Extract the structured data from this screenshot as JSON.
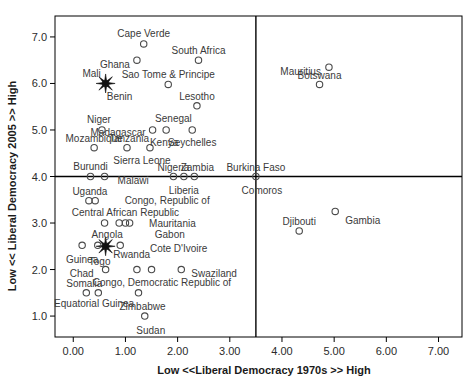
{
  "chart_data": {
    "type": "scatter",
    "title": "",
    "xlabel": "Low <<Liberal Democracy 1970s >> High",
    "ylabel": "Low << Liberal Democracy 2005 >> High",
    "xlim": [
      -0.35,
      7.45
    ],
    "ylim": [
      0.55,
      7.45
    ],
    "xticks": [
      "0.00",
      "1.00",
      "2.00",
      "3.00",
      "4.00",
      "5.00",
      "6.00",
      "7.00"
    ],
    "xtickvals": [
      0,
      1,
      2,
      3,
      4,
      5,
      6,
      7
    ],
    "yticks": [
      "1.0",
      "2.0",
      "3.0",
      "4.0",
      "5.0",
      "6.0",
      "7.0"
    ],
    "ytickvals": [
      1,
      2,
      3,
      4,
      5,
      6,
      7
    ],
    "grid": false,
    "legend": "none",
    "quadrant_lines": {
      "vertical_x": 3.5,
      "horizontal_y": 4.0
    },
    "points": [
      {
        "label": "Cape Verde",
        "x": 1.35,
        "y": 6.85,
        "marker": "circle",
        "label_dx": 0,
        "label_dy": -10,
        "anchor": "middle"
      },
      {
        "label": "South Africa",
        "x": 2.4,
        "y": 6.5,
        "marker": "circle",
        "label_dx": 0,
        "label_dy": -10,
        "anchor": "middle"
      },
      {
        "label": "Mauritius",
        "x": 4.9,
        "y": 6.35,
        "marker": "circle",
        "label_dx": -8,
        "label_dy": 4,
        "anchor": "end"
      },
      {
        "label": "Ghana",
        "x": 1.22,
        "y": 6.5,
        "marker": "circle",
        "label_dx": -7,
        "label_dy": 4,
        "anchor": "end"
      },
      {
        "label": "Botswana",
        "x": 4.72,
        "y": 5.98,
        "marker": "circle",
        "label_dx": 0,
        "label_dy": -9,
        "anchor": "middle"
      },
      {
        "label": "Sao Tome & Principe",
        "x": 1.82,
        "y": 5.98,
        "marker": "circle",
        "label_dx": 0,
        "label_dy": -10,
        "anchor": "middle"
      },
      {
        "label": "Mali",
        "x": 0.62,
        "y": 6.0,
        "marker": "star",
        "label_dx": -14,
        "label_dy": -10,
        "anchor": "middle"
      },
      {
        "label": "Benin",
        "x": 0.62,
        "y": 6.0,
        "marker": "none",
        "label_dx": 14,
        "label_dy": 13,
        "anchor": "middle"
      },
      {
        "label": "Lesotho",
        "x": 2.37,
        "y": 5.52,
        "marker": "circle",
        "label_dx": 0,
        "label_dy": -9,
        "anchor": "middle"
      },
      {
        "label": "Senegal",
        "x": 1.92,
        "y": 5.25,
        "marker": "none",
        "label_dx": 0,
        "label_dy": 0,
        "anchor": "middle"
      },
      {
        "label": "Niger",
        "x": 0.55,
        "y": 5.0,
        "marker": "circle",
        "label_dx": -3,
        "label_dy": -10,
        "anchor": "middle"
      },
      {
        "label": "Madagascar",
        "x": 1.52,
        "y": 5.0,
        "marker": "circle",
        "label_dx": -7,
        "label_dy": 3,
        "anchor": "end"
      },
      {
        "label": "Kenya",
        "x": 1.78,
        "y": 5.0,
        "marker": "circle",
        "label_dx": -2,
        "label_dy": 13,
        "anchor": "middle"
      },
      {
        "label": "Seychelles",
        "x": 2.28,
        "y": 5.0,
        "marker": "circle",
        "label_dx": 0,
        "label_dy": 13,
        "anchor": "middle"
      },
      {
        "label": "Mozambique",
        "x": 0.4,
        "y": 4.62,
        "marker": "circle",
        "label_dx": 0,
        "label_dy": -9,
        "anchor": "middle"
      },
      {
        "label": "Tanzania",
        "x": 1.03,
        "y": 4.62,
        "marker": "circle",
        "label_dx": 2,
        "label_dy": -9,
        "anchor": "middle"
      },
      {
        "label": "Sierra Leone",
        "x": 1.47,
        "y": 4.62,
        "marker": "circle",
        "label_dx": -8,
        "label_dy": 13,
        "anchor": "middle"
      },
      {
        "label": "Burundi",
        "x": 0.33,
        "y": 4.0,
        "marker": "circle",
        "label_dx": 0,
        "label_dy": -10,
        "anchor": "middle"
      },
      {
        "label": "Malawi",
        "x": 0.6,
        "y": 4.0,
        "marker": "circle",
        "label_dx": 13,
        "label_dy": 4,
        "anchor": "start"
      },
      {
        "label": "Nigeria",
        "x": 1.92,
        "y": 4.0,
        "marker": "circle",
        "label_dx": 0,
        "label_dy": -9,
        "anchor": "middle"
      },
      {
        "label": "Zambia",
        "x": 2.32,
        "y": 4.0,
        "marker": "circle",
        "label_dx": 3,
        "label_dy": -9,
        "anchor": "middle"
      },
      {
        "label": "Liberia",
        "x": 2.12,
        "y": 4.0,
        "marker": "circle",
        "label_dx": 0,
        "label_dy": 14,
        "anchor": "middle"
      },
      {
        "label": "Burkina Faso",
        "x": 3.5,
        "y": 4.0,
        "marker": "circle",
        "label_dx": 0,
        "label_dy": -9,
        "anchor": "middle"
      },
      {
        "label": "Comoros",
        "x": 3.5,
        "y": 4.0,
        "marker": "none",
        "label_dx": 6,
        "label_dy": 14,
        "anchor": "middle"
      },
      {
        "label": "Uganda",
        "x": 0.3,
        "y": 3.48,
        "marker": "circle",
        "label_dx": 1,
        "label_dy": -9,
        "anchor": "middle"
      },
      {
        "label": "Uganda2",
        "x": 0.42,
        "y": 3.48,
        "marker": "circle",
        "label_dx": 0,
        "label_dy": 0,
        "anchor": "middle",
        "hide_label": true
      },
      {
        "label": "Congo, Republic of",
        "x": 1.8,
        "y": 3.48,
        "marker": "none",
        "label_dx": 0,
        "label_dy": 0,
        "anchor": "middle"
      },
      {
        "label": "Central African Republic",
        "x": 1.0,
        "y": 3.22,
        "marker": "none",
        "label_dx": 0,
        "label_dy": 0,
        "anchor": "middle"
      },
      {
        "label": "",
        "x": 0.6,
        "y": 3.0,
        "marker": "circle",
        "label_dx": 0,
        "label_dy": 0,
        "anchor": "middle"
      },
      {
        "label": "",
        "x": 0.88,
        "y": 3.0,
        "marker": "circle",
        "label_dx": 0,
        "label_dy": 0,
        "anchor": "middle"
      },
      {
        "label": "",
        "x": 1.0,
        "y": 3.0,
        "marker": "circle",
        "label_dx": 0,
        "label_dy": 0,
        "anchor": "middle"
      },
      {
        "label": "",
        "x": 1.08,
        "y": 3.0,
        "marker": "circle",
        "label_dx": 0,
        "label_dy": 0,
        "anchor": "middle"
      },
      {
        "label": "Mauritania",
        "x": 1.9,
        "y": 3.0,
        "marker": "none",
        "label_dx": 0,
        "label_dy": 0,
        "anchor": "middle"
      },
      {
        "label": "Angola",
        "x": 0.65,
        "y": 2.75,
        "marker": "none",
        "label_dx": 0,
        "label_dy": 0,
        "anchor": "middle"
      },
      {
        "label": "Gabon",
        "x": 1.85,
        "y": 2.75,
        "marker": "none",
        "label_dx": 0,
        "label_dy": 0,
        "anchor": "middle"
      },
      {
        "label": "Guinea",
        "x": 0.17,
        "y": 2.52,
        "marker": "circle",
        "label_dx": 0,
        "label_dy": 14,
        "anchor": "middle"
      },
      {
        "label": "Togo",
        "x": 0.62,
        "y": 2.5,
        "marker": "star",
        "label_dx": -6,
        "label_dy": 15,
        "anchor": "middle"
      },
      {
        "label": "",
        "x": 0.47,
        "y": 2.52,
        "marker": "circle",
        "label_dx": 0,
        "label_dy": 0,
        "anchor": "middle"
      },
      {
        "label": "",
        "x": 0.9,
        "y": 2.52,
        "marker": "circle",
        "label_dx": 0,
        "label_dy": 0,
        "anchor": "middle"
      },
      {
        "label": "Cote D'Ivoire",
        "x": 2.02,
        "y": 2.45,
        "marker": "none",
        "label_dx": 0,
        "label_dy": 0,
        "anchor": "middle"
      },
      {
        "label": "Rwanda",
        "x": 1.12,
        "y": 2.32,
        "marker": "none",
        "label_dx": 0,
        "label_dy": 0,
        "anchor": "middle"
      },
      {
        "label": "Chad",
        "x": 0.62,
        "y": 2.0,
        "marker": "circle",
        "label_dx": -12,
        "label_dy": 4,
        "anchor": "end"
      },
      {
        "label": "",
        "x": 1.22,
        "y": 2.0,
        "marker": "circle",
        "label_dx": 0,
        "label_dy": 0,
        "anchor": "middle"
      },
      {
        "label": "",
        "x": 1.5,
        "y": 2.0,
        "marker": "circle",
        "label_dx": 0,
        "label_dy": 0,
        "anchor": "middle"
      },
      {
        "label": "Swaziland",
        "x": 2.07,
        "y": 2.0,
        "marker": "circle",
        "label_dx": 10,
        "label_dy": 4,
        "anchor": "start"
      },
      {
        "label": "Somalia",
        "x": 0.25,
        "y": 1.5,
        "marker": "circle",
        "label_dx": -2,
        "label_dy": -9,
        "anchor": "middle"
      },
      {
        "label": "Congo, Democratic Republic of",
        "x": 1.7,
        "y": 1.72,
        "marker": "none",
        "label_dx": 0,
        "label_dy": 0,
        "anchor": "middle"
      },
      {
        "label": "",
        "x": 0.48,
        "y": 1.5,
        "marker": "circle",
        "label_dx": 0,
        "label_dy": 0,
        "anchor": "middle"
      },
      {
        "label": "Zimbabwe",
        "x": 1.25,
        "y": 1.5,
        "marker": "circle",
        "label_dx": 4,
        "label_dy": 14,
        "anchor": "middle"
      },
      {
        "label": "Equatorial Guinea",
        "x": 0.4,
        "y": 1.28,
        "marker": "none",
        "label_dx": 0,
        "label_dy": 0,
        "anchor": "middle"
      },
      {
        "label": "Sudan",
        "x": 1.37,
        "y": 1.0,
        "marker": "circle",
        "label_dx": 6,
        "label_dy": 14,
        "anchor": "middle"
      },
      {
        "label": "Gambia",
        "x": 5.02,
        "y": 3.25,
        "marker": "circle",
        "label_dx": 10,
        "label_dy": 9,
        "anchor": "start"
      },
      {
        "label": "Djibouti",
        "x": 4.33,
        "y": 2.83,
        "marker": "circle",
        "label_dx": 0,
        "label_dy": -9,
        "anchor": "middle"
      }
    ]
  },
  "axes": {
    "x_title": "Low <<Liberal Democracy 1970s >> High",
    "y_title": "Low << Liberal Democracy 2005 >> High"
  }
}
